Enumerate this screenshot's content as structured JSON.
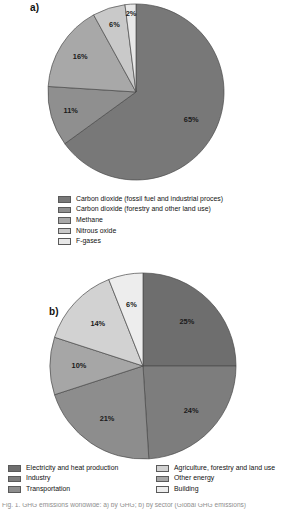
{
  "panels": {
    "a": {
      "label": "a)"
    },
    "b": {
      "label": "b)"
    }
  },
  "chart_data": [
    {
      "type": "pie",
      "name": "global-greenhouse-gas-emissions-by-gas",
      "title": "",
      "panel": "a)",
      "categories": [
        "Carbon dioxide (fossil fuel and industrial proces)",
        "Carbon dioxide (forestry and other land use)",
        "Methane",
        "Nitrous oxide",
        "F-gases"
      ],
      "values": [
        65,
        11,
        16,
        6,
        2
      ],
      "value_labels": [
        "65%",
        "11%",
        "16%",
        "6%",
        "2%"
      ],
      "colors": [
        "#787878",
        "#8f8f8f",
        "#a8a8a8",
        "#c9c9c9",
        "#e8e8e8"
      ],
      "start_angle_deg": 0,
      "direction": "clockwise",
      "legend_position": "bottom"
    },
    {
      "type": "pie",
      "name": "greenhouse-gas-emissions-by-economic-sector",
      "title": "",
      "panel": "b)",
      "categories": [
        "Electricity and heat production",
        "Industry",
        "Transportation",
        "Other energy",
        "Agriculture, forestry and land use",
        "Building"
      ],
      "values": [
        25,
        24,
        21,
        10,
        14,
        6
      ],
      "value_labels": [
        "25%",
        "24%",
        "21%",
        "10%",
        "14%",
        "6%"
      ],
      "colors": [
        "#6e6e6e",
        "#7d7d7d",
        "#8d8d8d",
        "#a6a6a6",
        "#d2d2d2",
        "#ededed"
      ],
      "start_angle_deg": 0,
      "direction": "clockwise",
      "legend_position": "bottom"
    }
  ],
  "legend_a": {
    "items": [
      {
        "label": "Carbon dioxide (fossil fuel and industrial proces)",
        "color": "#787878"
      },
      {
        "label": "Carbon dioxide (forestry and other land use)",
        "color": "#8f8f8f"
      },
      {
        "label": "Methane",
        "color": "#a8a8a8"
      },
      {
        "label": "Nitrous oxide",
        "color": "#c9c9c9"
      },
      {
        "label": "F-gases",
        "color": "#e8e8e8"
      }
    ]
  },
  "legend_b": {
    "left_items": [
      {
        "label": "Electricity and heat production",
        "color": "#6e6e6e"
      },
      {
        "label": "Industry",
        "color": "#7d7d7d"
      },
      {
        "label": "Transportation",
        "color": "#8d8d8d"
      }
    ],
    "right_items": [
      {
        "label": "Agriculture, forestry and land use",
        "color": "#d2d2d2"
      },
      {
        "label": "Other energy",
        "color": "#a6a6a6"
      },
      {
        "label": "Building",
        "color": "#ededed"
      }
    ]
  },
  "caption": {
    "clipped_line": "Fig. 1. GHG emissions worldwide: a) by GHG; b) by sector (Global GHG emissions)"
  }
}
